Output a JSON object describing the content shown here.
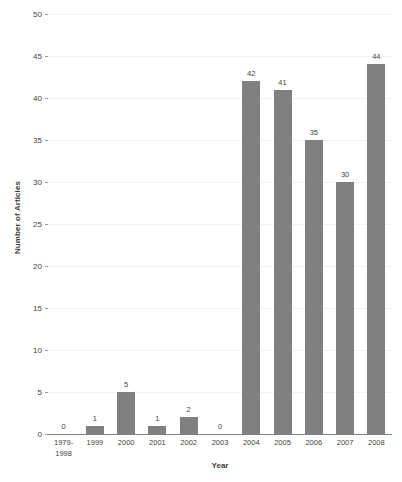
{
  "chart_data": {
    "type": "bar",
    "title": "",
    "xlabel": "Year",
    "ylabel": "Number of Articles",
    "categories": [
      "1979-1998",
      "1999",
      "2000",
      "2001",
      "2002",
      "2003",
      "2004",
      "2005",
      "2006",
      "2007",
      "2008"
    ],
    "category_lines": [
      [
        "1979-",
        "1998"
      ],
      [
        "1999"
      ],
      [
        "2000"
      ],
      [
        "2001"
      ],
      [
        "2002"
      ],
      [
        "2003"
      ],
      [
        "2004"
      ],
      [
        "2005"
      ],
      [
        "2006"
      ],
      [
        "2007"
      ],
      [
        "2008"
      ]
    ],
    "values": [
      0,
      1,
      5,
      1,
      2,
      0,
      42,
      41,
      35,
      30,
      44
    ],
    "data_labels": [
      "0",
      "1",
      "5",
      "1",
      "2",
      "0",
      "42",
      "41",
      "35",
      "30",
      "44"
    ],
    "ylim": [
      0,
      50
    ],
    "ytick_step": 5,
    "yticks": [
      0,
      5,
      10,
      15,
      20,
      25,
      30,
      35,
      40,
      45,
      50
    ],
    "ytick_labels": [
      "0",
      "5",
      "10",
      "15",
      "20",
      "25",
      "30",
      "35",
      "40",
      "45",
      "50"
    ],
    "grid": true,
    "legend": false,
    "bar_color": "#808080",
    "gridline_color": "#f2f2f2",
    "axis_color": "#808080",
    "text_color": "#3f3f3f"
  }
}
